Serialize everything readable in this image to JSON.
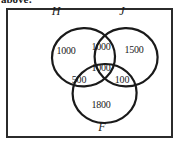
{
  "caption": {
    "text": "above:"
  },
  "diagram": {
    "type": "venn-3-set",
    "set_labels": [
      {
        "name": "H",
        "text": "H",
        "x": 56,
        "y": 11
      },
      {
        "name": "J",
        "text": "J",
        "x": 122,
        "y": 11
      },
      {
        "name": "F",
        "text": "F",
        "x": 102,
        "y": 126
      }
    ],
    "regions": [
      {
        "name": "H-only",
        "value": "1000",
        "x": 66,
        "y": 50
      },
      {
        "name": "H-and-J",
        "value": "1000",
        "x": 101,
        "y": 46
      },
      {
        "name": "J-only",
        "value": "1500",
        "x": 134,
        "y": 49
      },
      {
        "name": "H-and-J-and-F",
        "value": "1000",
        "x": 101,
        "y": 67
      },
      {
        "name": "H-and-F",
        "value": "500",
        "x": 79,
        "y": 79
      },
      {
        "name": "J-and-F",
        "value": "100",
        "x": 122,
        "y": 79
      },
      {
        "name": "F-only",
        "value": "1800",
        "x": 101,
        "y": 104
      }
    ],
    "circles": [
      {
        "name": "circle-H",
        "cx": 80,
        "cy": 57,
        "r": 31
      },
      {
        "name": "circle-J",
        "cx": 122,
        "cy": 57,
        "r": 31
      },
      {
        "name": "circle-F",
        "cx": 101,
        "cy": 93,
        "r": 31
      }
    ],
    "stroke_color": "#1a1a1a",
    "frame_color": "#2b2b2b",
    "background_color": "#ffffff"
  }
}
